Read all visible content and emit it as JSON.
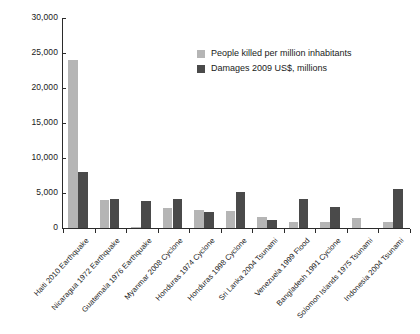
{
  "chart_data": {
    "type": "bar",
    "title": "",
    "subtitle": "",
    "xlabel": "",
    "ylabel": "",
    "ylim": [
      0,
      30000
    ],
    "ytick_labels": [
      "0",
      "5,000",
      "10,000",
      "15,000",
      "20,000",
      "25,000",
      "30,000"
    ],
    "ytick_values": [
      0,
      5000,
      10000,
      15000,
      20000,
      25000,
      30000
    ],
    "grid": false,
    "legend_position": "upper-center",
    "categories": [
      "Haiti 2010 Earthquake",
      "Nicaragua 1972 Earthquake",
      "Guatemala 1976 Earthquake",
      "Myanmar 2008 Cyclone",
      "Honduras 1974 Cyclone",
      "Honduras 1998 Cyclone",
      "Sri Lanka 2004 Tsunami",
      "Venezuela 1999 Flood",
      "Bangladesh 1991 Cyclone",
      "Solomon Islands 1975 Tsunami",
      "Indonesia 2004 Tsunami"
    ],
    "series": [
      {
        "name": "People killed per million inhabitants",
        "color": "#b5b5b5",
        "values": [
          24000,
          4000,
          150,
          2900,
          2600,
          2500,
          1600,
          900,
          900,
          1500,
          800
        ]
      },
      {
        "name": "Damages 2009 US$, millions",
        "color": "#4a4a4a",
        "values": [
          8000,
          4200,
          3800,
          4200,
          2300,
          5200,
          1100,
          4200,
          3000,
          0,
          5600
        ]
      }
    ]
  },
  "legend": {
    "items": [
      {
        "label": "People killed per million inhabitants",
        "swatch": "killed"
      },
      {
        "label": "Damages 2009 US$, millions",
        "swatch": "damages"
      }
    ]
  }
}
